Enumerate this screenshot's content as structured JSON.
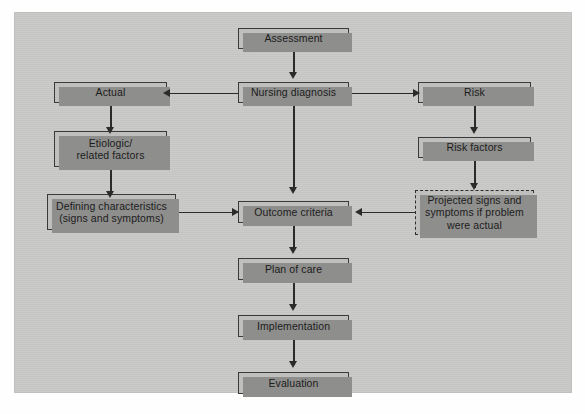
{
  "figure": {
    "type": "flowchart",
    "colors": {
      "canvas_background": "#c9c9c7",
      "node_fill": "#bfbfbd",
      "node_border": "#3a3a3a",
      "node_shadow": "#8e8e8c",
      "connector": "#2b2b2b",
      "text": "#1c1c1c"
    },
    "nodes": [
      {
        "id": "assessment",
        "label": "Assessment",
        "style": "solid",
        "column": "center"
      },
      {
        "id": "nursing_diagnosis",
        "label": "Nursing diagnosis",
        "style": "solid",
        "column": "center"
      },
      {
        "id": "actual",
        "label": "Actual",
        "style": "solid",
        "column": "left"
      },
      {
        "id": "etiologic",
        "label": "Etiologic/\nrelated factors",
        "style": "solid",
        "column": "left"
      },
      {
        "id": "defining",
        "label": "Defining characteristics\n(signs and symptoms)",
        "style": "solid",
        "column": "left"
      },
      {
        "id": "risk",
        "label": "Risk",
        "style": "solid",
        "column": "right"
      },
      {
        "id": "risk_factors",
        "label": "Risk factors",
        "style": "solid",
        "column": "right"
      },
      {
        "id": "projected",
        "label": "Projected signs and\nsymptoms if problem\nwere actual",
        "style": "dashed",
        "column": "right"
      },
      {
        "id": "outcome",
        "label": "Outcome criteria",
        "style": "solid",
        "column": "center"
      },
      {
        "id": "plan",
        "label": "Plan of care",
        "style": "solid",
        "column": "center"
      },
      {
        "id": "implementation",
        "label": "Implementation",
        "style": "solid",
        "column": "center"
      },
      {
        "id": "evaluation",
        "label": "Evaluation",
        "style": "solid",
        "column": "center"
      }
    ],
    "edges": [
      {
        "from": "assessment",
        "to": "nursing_diagnosis",
        "direction": "down"
      },
      {
        "from": "nursing_diagnosis",
        "to": "actual",
        "direction": "left"
      },
      {
        "from": "nursing_diagnosis",
        "to": "risk",
        "direction": "right"
      },
      {
        "from": "nursing_diagnosis",
        "to": "outcome",
        "direction": "down"
      },
      {
        "from": "actual",
        "to": "etiologic",
        "direction": "down"
      },
      {
        "from": "etiologic",
        "to": "defining",
        "direction": "down"
      },
      {
        "from": "defining",
        "to": "outcome",
        "direction": "right"
      },
      {
        "from": "risk",
        "to": "risk_factors",
        "direction": "down"
      },
      {
        "from": "risk_factors",
        "to": "projected",
        "direction": "down"
      },
      {
        "from": "projected",
        "to": "outcome",
        "direction": "left"
      },
      {
        "from": "outcome",
        "to": "plan",
        "direction": "down"
      },
      {
        "from": "plan",
        "to": "implementation",
        "direction": "down"
      },
      {
        "from": "implementation",
        "to": "evaluation",
        "direction": "down"
      }
    ]
  }
}
